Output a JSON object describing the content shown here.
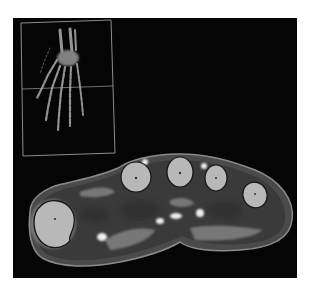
{
  "figure": {
    "background": "#050505",
    "page_background": "#ffffff"
  },
  "inset": {
    "label": "3D skeletal hand rendering",
    "frame_color": "#9a9a9a",
    "bone_color": "#a8a8a8",
    "slice_line": "horizontal slice position indicator"
  },
  "cross_section": {
    "label": "Axial slice through metacarpals",
    "colors": {
      "skin_outline": "#8a8a8a",
      "soft_tissue": "#555555",
      "muscle": "#3e3e3e",
      "fat": "#7a7a7a",
      "bone": "#b8b8b8",
      "bright_spot": "#eeeeee"
    },
    "bones": [
      {
        "name": "thumb-metacarpal"
      },
      {
        "name": "index-metacarpal"
      },
      {
        "name": "middle-metacarpal"
      },
      {
        "name": "ring-metacarpal"
      },
      {
        "name": "little-metacarpal"
      }
    ]
  }
}
